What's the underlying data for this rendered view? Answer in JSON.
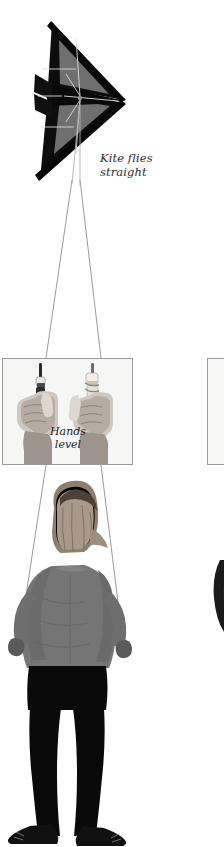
{
  "figure": {
    "title": "Kite flies straight",
    "background_color": "#ffffff",
    "width": 224,
    "height": 847
  },
  "captions": {
    "kite": {
      "line1": "Kite flies",
      "line2": "straight"
    },
    "hands": {
      "line1": "Hands",
      "line2": "level"
    }
  },
  "kite": {
    "name": "delta stunt kite",
    "sail_color": "#0d0d0d",
    "panel_color": "#6f6f6f",
    "spar_color": "#d8d8d8",
    "orientation": "nose pointing right"
  },
  "lines": {
    "count": 2,
    "color": "#9b9b9b",
    "label": "flying lines"
  },
  "hands_panel": {
    "label": "Hands level inset",
    "border_color": "#9a9a9a",
    "background_color": "#f6f6f4",
    "left_hand": "left hand gripping handle",
    "right_hand": "right hand gripping handle"
  },
  "hands_panel_partial": {
    "label": "adjacent panel edge"
  },
  "flyer": {
    "label": "kite flyer seen from behind",
    "hair_color": "#b9a98f",
    "top_color": "#757575",
    "pants_color": "#0a0a0a",
    "shoe_color": "#111111"
  },
  "flyer_partial": {
    "label": "second flyer partially visible",
    "hair_color": "#1a1a1a"
  }
}
